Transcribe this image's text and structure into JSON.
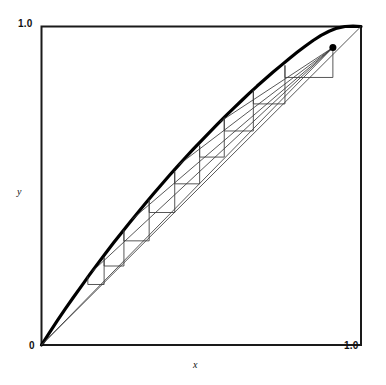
{
  "figure": {
    "title": "",
    "background_color": "#ffffff",
    "frame_color": "#1a1a1a",
    "curve_color": "#000000",
    "thin_line_color": "#3a3a3a",
    "marker_color": "#000000"
  },
  "axes": {
    "x_name": "x",
    "y_name": "y",
    "x_min_label": "0",
    "x_max_label": "1.0",
    "y_min_label": "0",
    "y_max_label": "1.0"
  },
  "chart_data": {
    "type": "line",
    "title": "",
    "xlabel": "x",
    "ylabel": "y",
    "xlim": [
      0,
      1
    ],
    "ylim": [
      0,
      1
    ],
    "grid": false,
    "legend": "none",
    "tick_labels": {
      "x": [
        "0",
        "1.0"
      ],
      "y": [
        "0",
        "1.0"
      ]
    },
    "series": [
      {
        "name": "concave-curve",
        "style": "thick-solid",
        "points": [
          [
            0.0,
            0.0
          ],
          [
            0.025,
            0.039
          ],
          [
            0.05,
            0.077
          ],
          [
            0.075,
            0.114
          ],
          [
            0.1,
            0.15
          ],
          [
            0.125,
            0.185
          ],
          [
            0.15,
            0.22
          ],
          [
            0.175,
            0.254
          ],
          [
            0.2,
            0.287
          ],
          [
            0.225,
            0.32
          ],
          [
            0.25,
            0.352
          ],
          [
            0.275,
            0.383
          ],
          [
            0.3,
            0.414
          ],
          [
            0.325,
            0.444
          ],
          [
            0.35,
            0.474
          ],
          [
            0.375,
            0.503
          ],
          [
            0.4,
            0.532
          ],
          [
            0.425,
            0.56
          ],
          [
            0.45,
            0.588
          ],
          [
            0.475,
            0.615
          ],
          [
            0.5,
            0.641
          ],
          [
            0.525,
            0.667
          ],
          [
            0.55,
            0.693
          ],
          [
            0.575,
            0.718
          ],
          [
            0.6,
            0.742
          ],
          [
            0.625,
            0.766
          ],
          [
            0.65,
            0.79
          ],
          [
            0.675,
            0.813
          ],
          [
            0.7,
            0.835
          ],
          [
            0.725,
            0.857
          ],
          [
            0.75,
            0.878
          ],
          [
            0.775,
            0.899
          ],
          [
            0.8,
            0.919
          ],
          [
            0.825,
            0.938
          ],
          [
            0.85,
            0.956
          ],
          [
            0.875,
            0.972
          ],
          [
            0.9,
            0.985
          ],
          [
            0.925,
            0.995
          ],
          [
            0.95,
            1.0
          ],
          [
            0.975,
            1.001
          ],
          [
            1.0,
            1.0
          ]
        ]
      },
      {
        "name": "diagonal-identity-line",
        "style": "thin-solid",
        "points": [
          [
            0.0,
            0.0
          ],
          [
            1.0,
            1.0
          ]
        ]
      },
      {
        "name": "fan-chord-1",
        "style": "thin-solid",
        "points": [
          [
            0.0,
            0.0
          ],
          [
            0.912,
            0.934
          ]
        ]
      },
      {
        "name": "fan-chord-2",
        "style": "thin-solid",
        "points": [
          [
            0.16,
            0.232
          ],
          [
            0.912,
            0.934
          ]
        ]
      },
      {
        "name": "fan-chord-3",
        "style": "thin-solid",
        "points": [
          [
            0.285,
            0.396
          ],
          [
            0.912,
            0.934
          ]
        ]
      },
      {
        "name": "fan-chord-4",
        "style": "thin-solid",
        "points": [
          [
            0.43,
            0.566
          ],
          [
            0.912,
            0.934
          ]
        ]
      },
      {
        "name": "fan-chord-5",
        "style": "thin-solid",
        "points": [
          [
            0.56,
            0.702
          ],
          [
            0.912,
            0.934
          ]
        ]
      },
      {
        "name": "staircase-cobweb",
        "style": "thin-solid",
        "points": [
          [
            0.145,
            0.214
          ],
          [
            0.145,
            0.19
          ],
          [
            0.196,
            0.19
          ],
          [
            0.196,
            0.275
          ],
          [
            0.196,
            0.248
          ],
          [
            0.258,
            0.248
          ],
          [
            0.258,
            0.36
          ],
          [
            0.258,
            0.327
          ],
          [
            0.337,
            0.327
          ],
          [
            0.337,
            0.456
          ],
          [
            0.337,
            0.416
          ],
          [
            0.417,
            0.416
          ],
          [
            0.417,
            0.545
          ],
          [
            0.417,
            0.506
          ],
          [
            0.495,
            0.506
          ],
          [
            0.495,
            0.626
          ],
          [
            0.495,
            0.59
          ],
          [
            0.572,
            0.59
          ],
          [
            0.572,
            0.714
          ],
          [
            0.572,
            0.672
          ],
          [
            0.663,
            0.672
          ],
          [
            0.663,
            0.8
          ],
          [
            0.663,
            0.757
          ],
          [
            0.762,
            0.757
          ],
          [
            0.762,
            0.878
          ],
          [
            0.762,
            0.84
          ],
          [
            0.912,
            0.84
          ],
          [
            0.912,
            0.934
          ]
        ]
      }
    ],
    "markers": [
      {
        "name": "fixed-point-dot",
        "x": 0.912,
        "y": 0.934,
        "size": 7,
        "color": "#000000"
      }
    ]
  }
}
